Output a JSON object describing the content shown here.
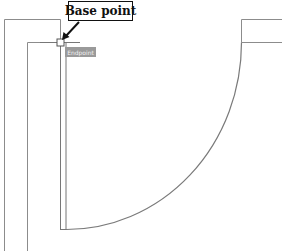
{
  "drawing": {
    "callout": {
      "label": "Base point"
    },
    "osnap_tooltip": {
      "label": "Endpoint"
    },
    "colors": {
      "line": "#8c8c8c",
      "arc": "#7a7a7a",
      "callout_border": "#111111",
      "arrow": "#111111",
      "tooltip_bg": "#9a9a9a"
    }
  }
}
